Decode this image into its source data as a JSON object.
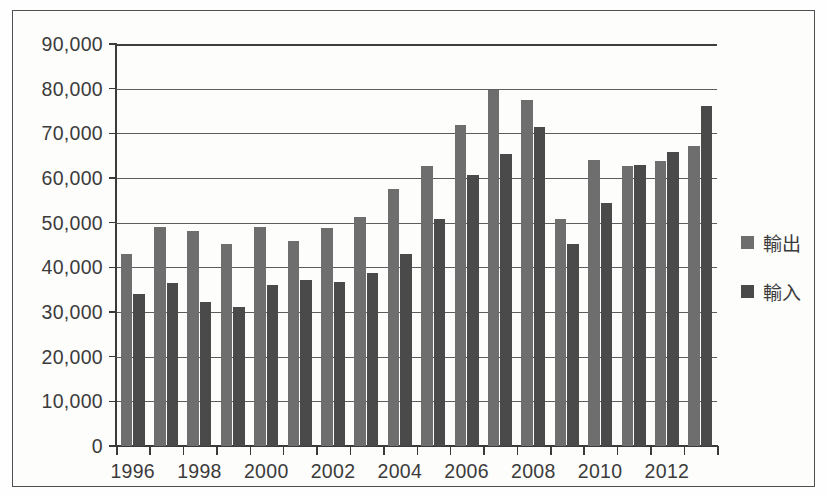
{
  "chart_data": {
    "type": "bar",
    "title": "",
    "subtitle": "",
    "xlabel": "",
    "ylabel": "",
    "ylim": [
      0,
      90000
    ],
    "ytick_values": [
      0,
      10000,
      20000,
      30000,
      40000,
      50000,
      60000,
      70000,
      80000,
      90000
    ],
    "ytick_labels": [
      "0",
      "10,000",
      "20,000",
      "30,000",
      "40,000",
      "50,000",
      "60,000",
      "70,000",
      "80,000",
      "90,000"
    ],
    "grid": true,
    "grid_axis": "y",
    "legend_position": "right",
    "categories": [
      1996,
      1997,
      1998,
      1999,
      2000,
      2001,
      2002,
      2003,
      2004,
      2005,
      2006,
      2007,
      2008,
      2009,
      2010,
      2011,
      2012,
      2013
    ],
    "xtick_labels": [
      "1996",
      "1998",
      "2000",
      "2002",
      "2004",
      "2006",
      "2008",
      "2010",
      "2012"
    ],
    "xtick_categories": [
      1996,
      1998,
      2000,
      2002,
      2004,
      2006,
      2008,
      2010,
      2012
    ],
    "series": [
      {
        "name": "輸出",
        "color": "#6e6e6e",
        "values": [
          43000,
          49000,
          48200,
          45200,
          49000,
          46000,
          48900,
          51200,
          57500,
          62800,
          71800,
          79700,
          77400,
          50800,
          64100,
          62700,
          63700,
          67200
        ]
      },
      {
        "name": "輸入",
        "color": "#4a4a4a",
        "values": [
          34000,
          36600,
          32200,
          31100,
          36100,
          37100,
          36700,
          38800,
          43000,
          50900,
          60600,
          65400,
          71500,
          45300,
          54500,
          62900,
          65900,
          76100
        ]
      }
    ]
  },
  "legend": {
    "items": [
      {
        "label": "輸出",
        "color": "#6e6e6e"
      },
      {
        "label": "輸入",
        "color": "#4a4a4a"
      }
    ]
  }
}
